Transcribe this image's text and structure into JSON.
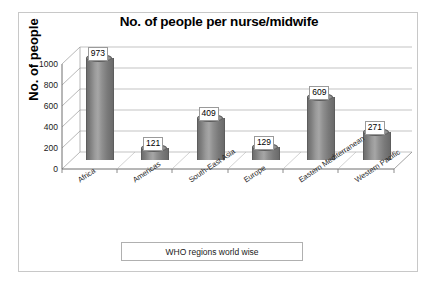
{
  "chart_data": {
    "type": "bar",
    "title": "No. of people per nurse/midwife",
    "xlabel": "WHO regions world wise",
    "ylabel": "No. of people",
    "categories": [
      "Africa",
      "Americas",
      "South-East Asia",
      "Europe",
      "Eastern Mediterranean",
      "Western Pacific"
    ],
    "values": [
      973,
      121,
      409,
      129,
      609,
      271
    ],
    "ylim": [
      0,
      1000
    ],
    "yticks": [
      "0",
      "200",
      "400",
      "600",
      "800",
      "1000"
    ],
    "grid": true,
    "legend": "none",
    "style": "3d-cylinder",
    "series_color": "#8a8a8a",
    "data_labels": [
      "973",
      "121",
      "409",
      "129",
      "609",
      "271"
    ]
  },
  "frame": {
    "border_color": "#c8c8c8",
    "background": "#ffffff"
  },
  "axis": {
    "line_color": "#6e6e6e",
    "grid_color": "#a9a9a9"
  }
}
